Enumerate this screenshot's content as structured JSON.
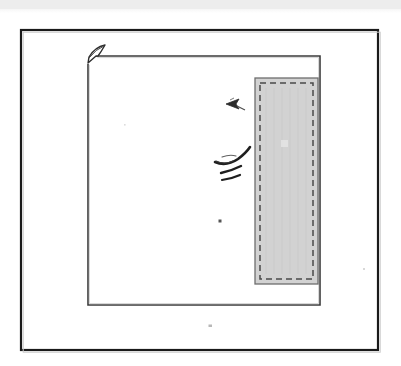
{
  "document": {
    "title": "Scanned line drawing",
    "background_color": "#ffffff",
    "width": 401,
    "height": 366
  },
  "scan_strip": {
    "name": "top-scan-artifact-strip",
    "color": "#ededed",
    "height": 9,
    "description": "Faint light gray horizontal band across the top edge of the scan"
  },
  "outer_frame": {
    "label": "Outer border frame",
    "stroke_color": "#1a1a1a",
    "stroke_width": 2.2,
    "x": 21,
    "y": 30,
    "width": 357,
    "height": 320
  },
  "inner_sheet": {
    "label": "Inner sheet outline",
    "stroke_color": "#3b3b3b",
    "stroke_width": 1.6,
    "x": 88,
    "y": 56,
    "width": 232,
    "height": 249,
    "corner_flap": {
      "label": "Folded corner flap",
      "stroke_color": "#2d2d2d",
      "description": "Small curved tab at the top-left corner of the sheet"
    }
  },
  "shaded_panel": {
    "label": "Shaded hatched panel",
    "fill_color": "#d2d2d2",
    "outer_stroke_color": "#6e6e6e",
    "dashed_stroke_color": "#4a4a4a",
    "dash_pattern": "6 4",
    "x": 255,
    "y": 78,
    "width": 63,
    "height": 206,
    "inset": 5
  },
  "annotations": [
    {
      "id": "arrow-mark",
      "label": "Left pointing arrow annotation",
      "type": "arrow",
      "x": 232,
      "y": 104,
      "color": "#2b2b2b"
    },
    {
      "id": "hook-stroke",
      "label": "Curved hook pen stroke",
      "type": "stroke",
      "x": 230,
      "y": 156,
      "color": "#1f1f1f"
    },
    {
      "id": "dash-mark-upper",
      "label": "Short slanted dash",
      "type": "dash",
      "x": 227,
      "y": 166,
      "color": "#1f1f1f"
    },
    {
      "id": "dash-mark-lower",
      "label": "Short slanted dash",
      "type": "dash",
      "x": 227,
      "y": 176,
      "color": "#1f1f1f"
    },
    {
      "id": "speck-upper",
      "label": "Small ink speck",
      "type": "dot",
      "x": 220,
      "y": 221,
      "color": "#555555"
    },
    {
      "id": "speck-lower",
      "label": "Faint ink speck below sheet",
      "type": "dot",
      "x": 210,
      "y": 326,
      "color": "#b8b8b8"
    }
  ],
  "captions": {
    "figure_label": "",
    "legend": ""
  }
}
